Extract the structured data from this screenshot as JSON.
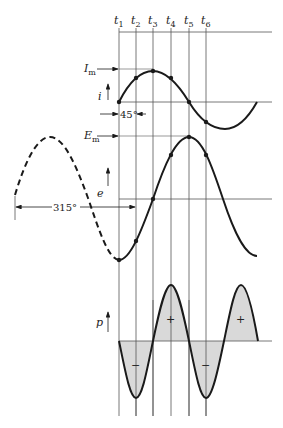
{
  "diagram": {
    "type": "phase-relationship waveforms (current, voltage, power)",
    "time_labels": [
      {
        "main": "t",
        "sub": "1"
      },
      {
        "main": "t",
        "sub": "2"
      },
      {
        "main": "t",
        "sub": "3"
      },
      {
        "main": "t",
        "sub": "4"
      },
      {
        "main": "t",
        "sub": "5"
      },
      {
        "main": "t",
        "sub": "6"
      }
    ],
    "current": {
      "axis_label": "i",
      "peak_label_main": "I",
      "peak_label_sub": "m",
      "phase_annotation": "45°"
    },
    "voltage": {
      "axis_label": "e",
      "peak_label_main": "E",
      "peak_label_sub": "m",
      "phase_annotation": "315°"
    },
    "power": {
      "axis_label": "p",
      "positive_sign": "+",
      "negative_sign": "−"
    },
    "colors": {
      "ink": "#1a1a1a",
      "grid": "#555555",
      "shade": "#d9d9d9"
    }
  }
}
